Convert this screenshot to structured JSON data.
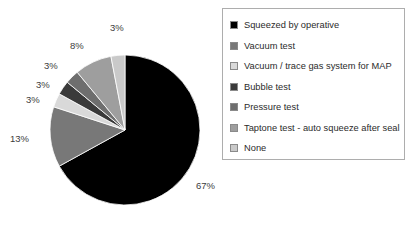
{
  "chart_data": {
    "type": "pie",
    "title": "",
    "labels": [
      "Squeezed by operative",
      "Vacuum test",
      "Vacuum / trace gas system for MAP",
      "Bubble test",
      "Pressure test",
      "Taptone test - auto squeeze after seal",
      "None"
    ],
    "values": [
      67,
      13,
      3,
      3,
      3,
      8,
      3
    ],
    "value_labels": [
      "67%",
      "13%",
      "3%",
      "3%",
      "3%",
      "8%",
      "3%"
    ],
    "colors": [
      "#000000",
      "#787878",
      "#d9d9d9",
      "#3a3a3a",
      "#6e6e6e",
      "#9e9e9e",
      "#c9c9c9"
    ],
    "start_angle": 0,
    "direction": "clockwise",
    "legend_position": "right",
    "grid": false
  },
  "legend": {
    "items": [
      {
        "label": "Squeezed by operative",
        "color": "#000000"
      },
      {
        "label": "Vacuum test",
        "color": "#787878"
      },
      {
        "label": "Vacuum / trace gas system for MAP",
        "color": "#d9d9d9"
      },
      {
        "label": "Bubble test",
        "color": "#3a3a3a"
      },
      {
        "label": "Pressure test",
        "color": "#6e6e6e"
      },
      {
        "label": "Taptone test - auto squeeze after seal",
        "color": "#9e9e9e"
      },
      {
        "label": "None",
        "color": "#c9c9c9"
      }
    ]
  },
  "pie_labels": [
    {
      "text": "67%",
      "x": 196,
      "y": 180
    },
    {
      "text": "13%",
      "x": 10,
      "y": 133
    },
    {
      "text": "3%",
      "x": 26,
      "y": 94
    },
    {
      "text": "3%",
      "x": 36,
      "y": 79
    },
    {
      "text": "3%",
      "x": 44,
      "y": 60
    },
    {
      "text": "8%",
      "x": 70,
      "y": 40
    },
    {
      "text": "3%",
      "x": 110,
      "y": 22
    }
  ]
}
